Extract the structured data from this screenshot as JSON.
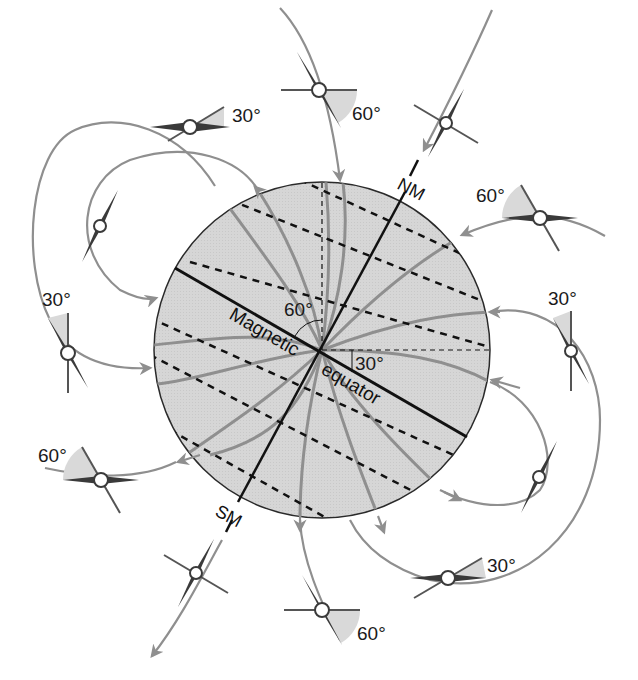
{
  "diagram": {
    "type": "magnetic-field-inclination",
    "colors": {
      "background": "#ffffff",
      "globe_fill": "#d6d6d6",
      "globe_stroke": "#2a2a2a",
      "field_line": "#8f8f8f",
      "axis_line": "#111111",
      "dashed_line": "#111111",
      "needle": "#3a3a3a",
      "needle_hub": "#ffffff",
      "angle_wedge": "#d9d9d9",
      "crossbar": "#555555",
      "text": "#1a1a1a"
    },
    "globe": {
      "cx": 322,
      "cy": 350,
      "r": 168
    },
    "labels": {
      "north_magnetic": "NM",
      "south_magnetic": "SM",
      "equator_word1": "Magnetic",
      "equator_word2": "equator",
      "center_angle_60": "60°",
      "center_angle_30": "30°"
    },
    "compasses": [
      {
        "id": "top-left",
        "x": 205,
        "y": 127,
        "label": "30°",
        "lx": 232,
        "ly": 122
      },
      {
        "id": "top",
        "x": 322,
        "y": 90,
        "label": "60°",
        "lx": 352,
        "ly": 120
      },
      {
        "id": "top-right-pole",
        "x": 446,
        "y": 123,
        "label": ""
      },
      {
        "id": "right-upper",
        "x": 540,
        "y": 218,
        "label": "60°",
        "lx": 476,
        "ly": 202
      },
      {
        "id": "left-upper",
        "x": 100,
        "y": 225,
        "label": ""
      },
      {
        "id": "left-mid",
        "x": 68,
        "y": 353,
        "label": "30°",
        "lx": 42,
        "ly": 306
      },
      {
        "id": "right-mid",
        "x": 571,
        "y": 351,
        "label": "30°",
        "lx": 548,
        "ly": 305
      },
      {
        "id": "left-lower",
        "x": 101,
        "y": 480,
        "label": "60°",
        "lx": 38,
        "ly": 462
      },
      {
        "id": "right-lower",
        "x": 539,
        "y": 477,
        "label": ""
      },
      {
        "id": "bottom-left-pole",
        "x": 196,
        "y": 573,
        "label": ""
      },
      {
        "id": "bottom-right",
        "x": 447,
        "y": 578,
        "label": "30°",
        "lx": 487,
        "ly": 572
      },
      {
        "id": "bottom",
        "x": 322,
        "y": 610,
        "label": "60°",
        "lx": 357,
        "ly": 640
      }
    ]
  }
}
